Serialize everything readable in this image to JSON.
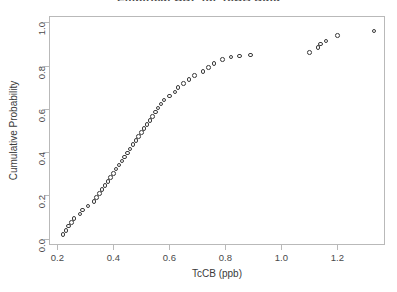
{
  "chart_data": {
    "type": "scatter",
    "title": "Empirical CDF for TcCB Data",
    "xlabel": "TcCB (ppb)",
    "ylabel": "Cumulative Probability",
    "xlim": [
      0.17,
      1.37
    ],
    "ylim": [
      -0.03,
      1.03
    ],
    "xticks": [
      0.2,
      0.4,
      0.6,
      0.8,
      1.0,
      1.2
    ],
    "xticklabels": [
      "0.2",
      "0.4",
      "0.6",
      "0.8",
      "1.0",
      "1.2"
    ],
    "yticks": [
      0.0,
      0.2,
      0.4,
      0.6,
      0.8,
      1.0
    ],
    "yticklabels": [
      "0.0",
      "0.2",
      "0.4",
      "0.6",
      "0.8",
      "1.0"
    ],
    "grid": false,
    "legend": null,
    "marker": "open-circle",
    "marker_color": "#3a3a3a",
    "series": [
      {
        "name": "Empirical CDF",
        "x": [
          0.22,
          0.23,
          0.24,
          0.25,
          0.26,
          0.28,
          0.29,
          0.31,
          0.33,
          0.34,
          0.35,
          0.36,
          0.37,
          0.38,
          0.39,
          0.4,
          0.41,
          0.42,
          0.43,
          0.44,
          0.45,
          0.46,
          0.47,
          0.48,
          0.49,
          0.5,
          0.51,
          0.52,
          0.53,
          0.54,
          0.55,
          0.56,
          0.57,
          0.58,
          0.6,
          0.62,
          0.63,
          0.65,
          0.67,
          0.69,
          0.72,
          0.74,
          0.76,
          0.79,
          0.82,
          0.85,
          0.89,
          1.1,
          1.13,
          1.14,
          1.16,
          1.2,
          1.33
        ],
        "y": [
          0.019,
          0.038,
          0.057,
          0.075,
          0.094,
          0.113,
          0.132,
          0.151,
          0.17,
          0.189,
          0.208,
          0.226,
          0.245,
          0.264,
          0.283,
          0.302,
          0.321,
          0.34,
          0.358,
          0.377,
          0.396,
          0.415,
          0.434,
          0.453,
          0.472,
          0.491,
          0.509,
          0.528,
          0.547,
          0.566,
          0.585,
          0.604,
          0.623,
          0.642,
          0.66,
          0.679,
          0.698,
          0.717,
          0.736,
          0.755,
          0.774,
          0.792,
          0.811,
          0.83,
          0.84,
          0.845,
          0.849,
          0.86,
          0.885,
          0.9,
          0.915,
          0.94,
          0.96
        ]
      }
    ]
  }
}
